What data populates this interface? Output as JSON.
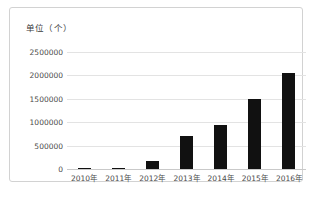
{
  "chart_data": {
    "type": "bar",
    "title": "单位（个）",
    "xlabel": "",
    "ylabel": "",
    "categories": [
      "2010年",
      "2011年",
      "2012年",
      "2013年",
      "2014年",
      "2015年",
      "2016年"
    ],
    "values": [
      12000,
      25000,
      170000,
      710000,
      950000,
      1500000,
      2050000
    ],
    "ytick_labels": [
      "0",
      "500000",
      "1000000",
      "1500000",
      "2000000",
      "2500000"
    ],
    "ytick_values": [
      0,
      500000,
      1000000,
      1500000,
      2000000,
      2500000
    ],
    "ylim": [
      0,
      2500000
    ],
    "grid": true,
    "legend": "none",
    "bar_color": "#111111",
    "grid_color": "#e3e3e3",
    "axis_color": "#c9c9c9",
    "frame_color": "#d2d2d2",
    "background": "#ffffff"
  }
}
